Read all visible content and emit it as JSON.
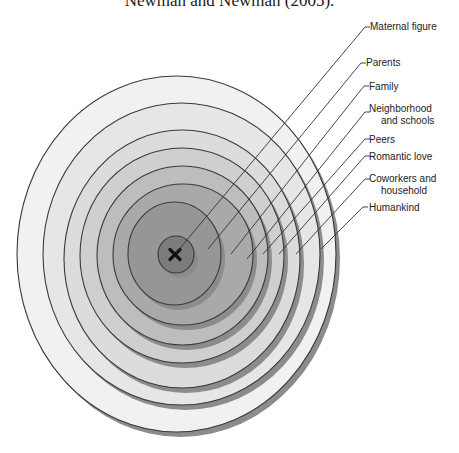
{
  "caption": "Newman and Newman (2005).",
  "diagram": {
    "type": "concentric-ellipses",
    "center_marker": "x-mark",
    "colors": {
      "stroke": "#3a3a3a",
      "shadow": "#8c8c8c",
      "leader": "#333333",
      "marker": "#111111"
    },
    "rings": [
      {
        "label": "Humankind",
        "lines": [
          "Humankind"
        ],
        "cx": 176.5,
        "cy": 254,
        "rx": 159.5,
        "ry": 178,
        "fill": "#f1f1f1",
        "hook": [
          363,
          207
        ],
        "end": [
          321,
          249
        ],
        "text": [
          369,
          211
        ]
      },
      {
        "label": "Coworkers and household",
        "lines": [
          "Coworkers and",
          "household"
        ],
        "cx": 181.5,
        "cy": 254,
        "rx": 138.5,
        "ry": 151,
        "fill": "#e6e6e6",
        "hook": [
          365,
          179
        ],
        "end": [
          296,
          254
        ],
        "text": [
          369,
          182
        ]
      },
      {
        "label": "Romantic love",
        "lines": [
          "Romantic love"
        ],
        "cx": 182,
        "cy": 259,
        "rx": 118,
        "ry": 129,
        "fill": "#dcdcdc",
        "hook": [
          365,
          156
        ],
        "end": [
          279,
          254
        ],
        "text": [
          369,
          160
        ]
      },
      {
        "label": "Peers",
        "lines": [
          "Peers"
        ],
        "cx": 182,
        "cy": 255.5,
        "rx": 102,
        "ry": 107.5,
        "fill": "#cfcfcf",
        "hook": [
          365,
          139
        ],
        "end": [
          263,
          254
        ],
        "text": [
          369,
          143
        ]
      },
      {
        "label": "Neighborhood and schools",
        "lines": [
          "Neighborhood",
          "and schools"
        ],
        "cx": 182.5,
        "cy": 255.5,
        "rx": 85.5,
        "ry": 89.5,
        "fill": "#bdbdbd",
        "hook": [
          365,
          112
        ],
        "end": [
          247,
          259
        ],
        "text": [
          369,
          112
        ]
      },
      {
        "label": "Family",
        "lines": [
          "Family"
        ],
        "cx": 183,
        "cy": 254.5,
        "rx": 70,
        "ry": 70.5,
        "fill": "#a9a9a9",
        "hook": [
          364,
          86
        ],
        "end": [
          231,
          254
        ],
        "text": [
          369,
          90
        ]
      },
      {
        "label": "Parents",
        "lines": [
          "Parents"
        ],
        "cx": 174.5,
        "cy": 253.5,
        "rx": 46.5,
        "ry": 51.5,
        "fill": "#969696",
        "hook": [
          361,
          63
        ],
        "end": [
          208,
          249
        ],
        "text": [
          366,
          66
        ]
      },
      {
        "label": "Maternal figure",
        "lines": [
          "Maternal figure"
        ],
        "cx": 176,
        "cy": 254.5,
        "rx": 18,
        "ry": 18.5,
        "fill": "#7c7c7c",
        "hook": [
          365,
          27
        ],
        "end": [
          176,
          253
        ],
        "text": [
          370,
          30
        ]
      }
    ]
  }
}
